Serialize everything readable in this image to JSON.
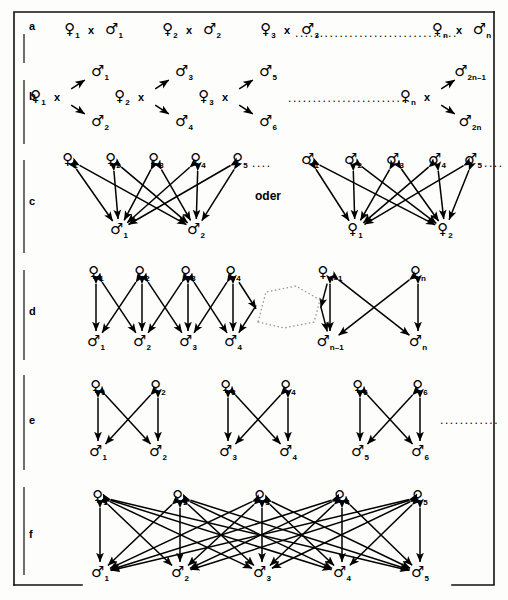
{
  "figure": {
    "connector_word": "oder",
    "row_labels": [
      "a",
      "b",
      "c",
      "d",
      "e",
      "f"
    ],
    "female_glyph": "♀",
    "male_glyph": "♂",
    "cross_symbol": "x",
    "ellipsis": "...............................",
    "ellipsis_short": "....",
    "ellipsis_mid": ".........."
  },
  "rows": {
    "a": {
      "label": "a",
      "pairs": [
        {
          "female": "♀",
          "fsub": "1",
          "cross": "x",
          "male": "♂",
          "msub": "1"
        },
        {
          "female": "♀",
          "fsub": "2",
          "cross": "x",
          "male": "♂",
          "msub": "2"
        },
        {
          "female": "♀",
          "fsub": "3",
          "cross": "x",
          "male": "♂",
          "msub": "3"
        },
        {
          "female": "♀",
          "fsub": "n",
          "cross": "x",
          "male": "♂",
          "msub": "n"
        }
      ],
      "dots": "................................."
    },
    "b": {
      "label": "b",
      "groups": [
        {
          "female": "♀",
          "fsub": "1",
          "cross": "x",
          "male_top": "♂",
          "mtsub": "1",
          "male_bot": "♂",
          "mbsub": "2"
        },
        {
          "female": "♀",
          "fsub": "2",
          "cross": "x",
          "male_top": "♂",
          "mtsub": "3",
          "male_bot": "♂",
          "mbsub": "4"
        },
        {
          "female": "♀",
          "fsub": "3",
          "cross": "x",
          "male_top": "♂",
          "mtsub": "5",
          "male_bot": "♂",
          "mbsub": "6"
        },
        {
          "female": "♀",
          "fsub": "n",
          "cross": "x",
          "male_top": "♂",
          "mtsub": "2n–1",
          "male_bot": "♂",
          "mbsub": "2n"
        }
      ],
      "dots": "........................."
    },
    "c": {
      "label": "c",
      "connector": "oder",
      "left": {
        "top": [
          {
            "g": "♀",
            "sub": "1"
          },
          {
            "g": "♀",
            "sub": "2"
          },
          {
            "g": "♀",
            "sub": "3"
          },
          {
            "g": "♀",
            "sub": "4"
          },
          {
            "g": "♀",
            "sub": "5"
          }
        ],
        "bottom": [
          {
            "g": "♂",
            "sub": "1"
          },
          {
            "g": "♂",
            "sub": "2"
          }
        ],
        "dots": "...."
      },
      "right": {
        "top": [
          {
            "g": "♂",
            "sub": "1"
          },
          {
            "g": "♂",
            "sub": "2"
          },
          {
            "g": "♂",
            "sub": "3"
          },
          {
            "g": "♂",
            "sub": "4"
          },
          {
            "g": "♂",
            "sub": "5"
          }
        ],
        "bottom": [
          {
            "g": "♀",
            "sub": "1"
          },
          {
            "g": "♀",
            "sub": "2"
          }
        ],
        "dots": "...."
      }
    },
    "d": {
      "label": "d",
      "top": [
        {
          "g": "♀",
          "sub": "1"
        },
        {
          "g": "♀",
          "sub": "2"
        },
        {
          "g": "♀",
          "sub": "3"
        },
        {
          "g": "♀",
          "sub": "4"
        },
        {
          "g": "♀",
          "sub": "n–1"
        },
        {
          "g": "♀",
          "sub": "n"
        }
      ],
      "bottom": [
        {
          "g": "♂",
          "sub": "1"
        },
        {
          "g": "♂",
          "sub": "2"
        },
        {
          "g": "♂",
          "sub": "3"
        },
        {
          "g": "♂",
          "sub": "4"
        },
        {
          "g": "♂",
          "sub": "n–1"
        },
        {
          "g": "♂",
          "sub": "n"
        }
      ]
    },
    "e": {
      "label": "e",
      "top": [
        {
          "g": "♀",
          "sub": "1"
        },
        {
          "g": "♀",
          "sub": "2"
        },
        {
          "g": "♀",
          "sub": "3"
        },
        {
          "g": "♀",
          "sub": "4"
        },
        {
          "g": "♀",
          "sub": "5"
        },
        {
          "g": "♀",
          "sub": "6"
        }
      ],
      "bottom": [
        {
          "g": "♂",
          "sub": "1"
        },
        {
          "g": "♂",
          "sub": "2"
        },
        {
          "g": "♂",
          "sub": "3"
        },
        {
          "g": "♂",
          "sub": "4"
        },
        {
          "g": "♂",
          "sub": "5"
        },
        {
          "g": "♂",
          "sub": "6"
        }
      ],
      "dots": "............"
    },
    "f": {
      "label": "f",
      "top": [
        {
          "g": "♀",
          "sub": "1"
        },
        {
          "g": "♀",
          "sub": "2"
        },
        {
          "g": "♀",
          "sub": "3"
        },
        {
          "g": "♀",
          "sub": "4"
        },
        {
          "g": "♀",
          "sub": "5"
        }
      ],
      "bottom": [
        {
          "g": "♂",
          "sub": "1"
        },
        {
          "g": "♂",
          "sub": "2"
        },
        {
          "g": "♂",
          "sub": "3"
        },
        {
          "g": "♂",
          "sub": "4"
        },
        {
          "g": "♂",
          "sub": "5"
        }
      ]
    }
  },
  "colors": {
    "ink": "#000000",
    "paper": "#fdfdfb",
    "rule": "#111111",
    "dotted": "#8a8a8a"
  }
}
